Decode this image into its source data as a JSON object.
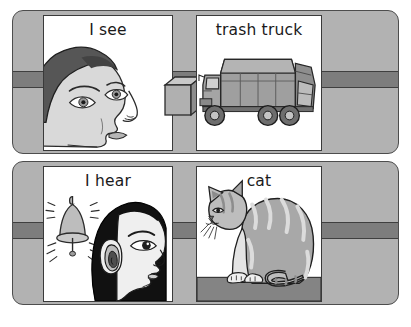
{
  "page": {
    "kind": "illustration-card-set",
    "background_color": "#ffffff",
    "strip_color": "#b2b2b2",
    "band_color": "#7d7d7d",
    "outline_color": "#3a3a3a",
    "panel_color": "#ffffff",
    "text_color": "#1a1a1a"
  },
  "rows": [
    {
      "name": "see-row",
      "panels": [
        {
          "caption": "I see",
          "illustration": "man-face-profile-looking-right",
          "icon_name": "eye-person-icon",
          "accent": "box-3d-icon"
        },
        {
          "caption": "trash truck",
          "illustration": "garbage-truck-side-view",
          "icon_name": "trash-truck-icon",
          "accent": ""
        }
      ]
    },
    {
      "name": "hear-row",
      "panels": [
        {
          "caption": "I hear",
          "illustration": "woman-profile-with-ringing-bell",
          "icon_name": "ear-person-icon",
          "accent": "bell-icon"
        },
        {
          "caption": "cat",
          "illustration": "tabby-cat-sitting",
          "icon_name": "cat-icon",
          "accent": "ground-strip"
        }
      ]
    }
  ],
  "palette": {
    "skin": "#d9d9d9",
    "hair_dark": "#555555",
    "hair_black": "#111111",
    "truck_body": "#9c9c9c",
    "truck_dark": "#6e6e6e",
    "cat_fur": "#a8a8a8",
    "cat_light": "#dcdcdc",
    "bell": "#bdbdbd",
    "ground": "#848484"
  }
}
